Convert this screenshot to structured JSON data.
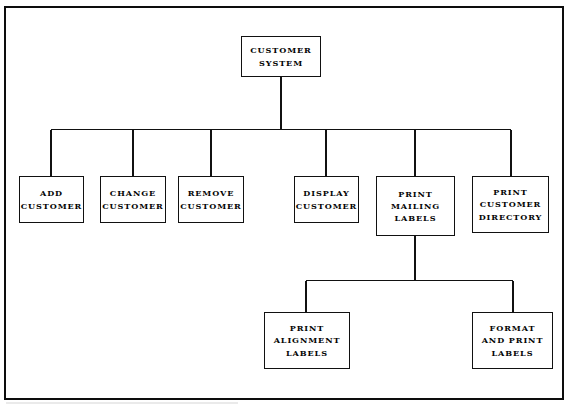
{
  "diagram": {
    "type": "hierarchy-tree",
    "frame": {
      "visible": true,
      "color": "#0d0d0d"
    },
    "line_color": "#111111",
    "background": "#ffffff",
    "nodes": [
      {
        "id": "customer-system",
        "label": "CUSTOMER\nSYSTEM",
        "level": 0,
        "x": 241,
        "y": 36,
        "w": 80,
        "h": 41
      },
      {
        "id": "add-customer",
        "label": "ADD\nCUSTOMER",
        "level": 1,
        "x": 19,
        "y": 176,
        "w": 65,
        "h": 47
      },
      {
        "id": "change-customer",
        "label": "CHANGE\nCUSTOMER",
        "level": 1,
        "x": 100,
        "y": 176,
        "w": 66,
        "h": 47
      },
      {
        "id": "remove-customer",
        "label": "REMOVE\nCUSTOMER",
        "level": 1,
        "x": 178,
        "y": 176,
        "w": 66,
        "h": 47
      },
      {
        "id": "display-customer",
        "label": "DISPLAY\nCUSTOMER",
        "level": 1,
        "x": 294,
        "y": 176,
        "w": 65,
        "h": 47
      },
      {
        "id": "print-mailing-labels",
        "label": "PRINT\nMAILING\nLABELS",
        "level": 1,
        "x": 376,
        "y": 176,
        "w": 79,
        "h": 60
      },
      {
        "id": "print-customer-directory",
        "label": "PRINT\nCUSTOMER\nDIRECTORY",
        "level": 1,
        "x": 472,
        "y": 176,
        "w": 77,
        "h": 57
      },
      {
        "id": "print-alignment-labels",
        "label": "PRINT\nALIGNMENT\nLABELS",
        "level": 2,
        "x": 264,
        "y": 312,
        "w": 86,
        "h": 57
      },
      {
        "id": "format-and-print-labels",
        "label": "FORMAT\nAND PRINT\nLABELS",
        "level": 2,
        "x": 472,
        "y": 312,
        "w": 81,
        "h": 57
      }
    ],
    "connectors": [
      {
        "from": "customer-system",
        "to": "add-customer"
      },
      {
        "from": "customer-system",
        "to": "change-customer"
      },
      {
        "from": "customer-system",
        "to": "remove-customer"
      },
      {
        "from": "customer-system",
        "to": "display-customer"
      },
      {
        "from": "customer-system",
        "to": "print-mailing-labels"
      },
      {
        "from": "customer-system",
        "to": "print-customer-directory"
      },
      {
        "from": "print-mailing-labels",
        "to": "print-alignment-labels"
      },
      {
        "from": "print-mailing-labels",
        "to": "format-and-print-labels"
      }
    ]
  }
}
